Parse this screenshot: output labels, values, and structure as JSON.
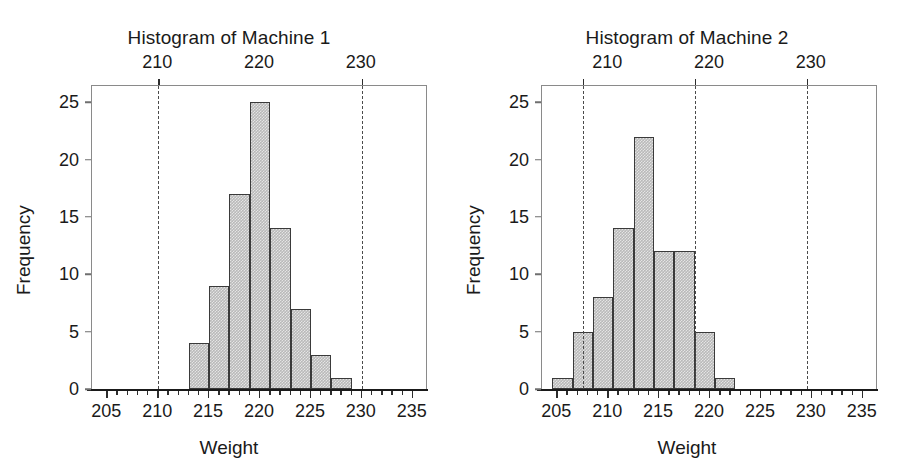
{
  "figure": {
    "background": "#ffffff",
    "bar_fill": "#b9b9b9",
    "bar_edge": "#3a3a3a",
    "spec_line_color": "#4a4a4a",
    "text_color": "#1a1a1a"
  },
  "panels": [
    {
      "key": "machine1",
      "title": "Histogram of Machine 1",
      "xlabel": "Weight",
      "ylabel": "Frequency",
      "x_ticks": [
        205,
        210,
        215,
        220,
        225,
        230,
        235
      ],
      "x_tick_labels": [
        "205",
        "210",
        "215",
        "220",
        "225",
        "230",
        "235"
      ],
      "y_ticks": [
        0,
        5,
        10,
        15,
        20,
        25
      ],
      "y_tick_labels": [
        "0",
        "5",
        "10",
        "15",
        "20",
        "25"
      ],
      "top_axis_ticks": [
        210,
        220,
        230
      ],
      "top_axis_labels": [
        "210",
        "220",
        "230"
      ],
      "spec_lines": [
        210,
        230
      ]
    },
    {
      "key": "machine2",
      "title": "Histogram of Machine 2",
      "xlabel": "Weight",
      "ylabel": "Frequency",
      "x_ticks": [
        205,
        210,
        215,
        220,
        225,
        230,
        235
      ],
      "x_tick_labels": [
        "205",
        "210",
        "215",
        "220",
        "225",
        "230",
        "235"
      ],
      "y_ticks": [
        0,
        5,
        10,
        15,
        20,
        25
      ],
      "y_tick_labels": [
        "0",
        "5",
        "10",
        "15",
        "20",
        "25"
      ],
      "top_axis_ticks": [
        210,
        220,
        230
      ],
      "top_axis_labels": [
        "210",
        "220",
        "230"
      ],
      "spec_lines": [
        207.5,
        218.5,
        229.5
      ]
    }
  ],
  "chart_data": [
    {
      "type": "bar",
      "title": "Histogram of Machine 1",
      "xlabel": "Weight",
      "ylabel": "Frequency",
      "xlim": [
        203.5,
        236.5
      ],
      "ylim": [
        0,
        26.5
      ],
      "grid": false,
      "legend": "none",
      "bin_width": 2,
      "bin_starts": [
        213,
        215,
        217,
        219,
        221,
        223,
        225,
        227
      ],
      "bin_ends": [
        215,
        217,
        219,
        221,
        223,
        225,
        227,
        229
      ],
      "categories": [
        "213-215",
        "215-217",
        "217-219",
        "219-221",
        "221-223",
        "223-225",
        "225-227",
        "227-229"
      ],
      "values": [
        4,
        9,
        17,
        25,
        14,
        7,
        3,
        1
      ],
      "x_tick_values": [
        205,
        210,
        215,
        220,
        225,
        230,
        235
      ],
      "y_tick_values": [
        0,
        5,
        10,
        15,
        20,
        25
      ],
      "top_axis_tick_values": [
        210,
        220,
        230
      ],
      "spec_limit_lines": [
        210,
        230
      ],
      "annotations": []
    },
    {
      "type": "bar",
      "title": "Histogram of Machine 2",
      "xlabel": "Weight",
      "ylabel": "Frequency",
      "xlim": [
        203.5,
        236.5
      ],
      "ylim": [
        0,
        26.5
      ],
      "grid": false,
      "legend": "none",
      "bin_width": 2,
      "bin_starts": [
        204.5,
        206.5,
        208.5,
        210.5,
        212.5,
        214.5,
        216.5,
        218.5,
        220.5
      ],
      "bin_ends": [
        206.5,
        208.5,
        210.5,
        212.5,
        214.5,
        216.5,
        218.5,
        220.5,
        222.5
      ],
      "categories": [
        "204.5-206.5",
        "206.5-208.5",
        "208.5-210.5",
        "210.5-212.5",
        "212.5-214.5",
        "214.5-216.5",
        "216.5-218.5",
        "218.5-220.5",
        "220.5-222.5"
      ],
      "values": [
        1,
        5,
        8,
        14,
        22,
        12,
        12,
        5,
        1
      ],
      "x_tick_values": [
        205,
        210,
        215,
        220,
        225,
        230,
        235
      ],
      "y_tick_values": [
        0,
        5,
        10,
        15,
        20,
        25
      ],
      "top_axis_tick_values": [
        210,
        220,
        230
      ],
      "spec_limit_lines": [
        207.5,
        218.5,
        229.5
      ],
      "annotations": []
    }
  ]
}
